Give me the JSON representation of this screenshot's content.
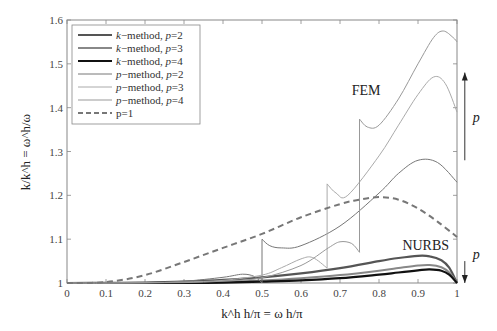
{
  "chart_data": {
    "type": "line",
    "title": "",
    "xlabel": "k^h h/π = ω h/π",
    "ylabel": "k/k^h = ω^h/ω",
    "xlim": [
      0,
      1
    ],
    "ylim": [
      1,
      1.6
    ],
    "xticks": [
      "0",
      "0.1",
      "0.2",
      "0.3",
      "0.4",
      "0.5",
      "0.6",
      "0.7",
      "0.8",
      "0.9",
      "1"
    ],
    "yticks": [
      "1",
      "1.1",
      "1.2",
      "1.3",
      "1.4",
      "1.5",
      "1.6"
    ],
    "grid": false,
    "legend_position": "upper left",
    "annotations": [
      {
        "text": "FEM",
        "x": 0.73,
        "y": 1.43
      },
      {
        "text": "NURBS",
        "x": 0.86,
        "y": 1.075
      },
      {
        "text": "p",
        "arrow": "up",
        "x": 1.02,
        "y_from": 1.28,
        "y_to": 1.48
      },
      {
        "text": "p",
        "arrow": "down",
        "x": 1.02,
        "y_from": 1.05,
        "y_to": 1.0
      }
    ],
    "series": [
      {
        "name": "k−method, p=2",
        "color": "#555555",
        "width": 2.2,
        "dash": "",
        "x": [
          0,
          0.1,
          0.2,
          0.3,
          0.4,
          0.5,
          0.6,
          0.7,
          0.8,
          0.85,
          0.9,
          0.93,
          0.96,
          0.98,
          1.0
        ],
        "y": [
          1,
          1.0003,
          1.001,
          1.003,
          1.007,
          1.013,
          1.022,
          1.034,
          1.05,
          1.057,
          1.062,
          1.061,
          1.052,
          1.035,
          1.0
        ]
      },
      {
        "name": "k−method, p=3",
        "color": "#888888",
        "width": 2.0,
        "dash": "",
        "x": [
          0,
          0.1,
          0.2,
          0.3,
          0.4,
          0.5,
          0.6,
          0.7,
          0.8,
          0.85,
          0.9,
          0.93,
          0.96,
          0.98,
          1.0
        ],
        "y": [
          1,
          1.0001,
          1.0004,
          1.001,
          1.003,
          1.006,
          1.011,
          1.018,
          1.028,
          1.034,
          1.04,
          1.041,
          1.036,
          1.024,
          1.0
        ]
      },
      {
        "name": "k−method, p=4",
        "color": "#111111",
        "width": 2.2,
        "dash": "",
        "x": [
          0,
          0.1,
          0.2,
          0.3,
          0.4,
          0.5,
          0.6,
          0.7,
          0.8,
          0.85,
          0.9,
          0.93,
          0.96,
          0.98,
          1.0
        ],
        "y": [
          1,
          1.0,
          1.0001,
          1.0004,
          1.001,
          1.003,
          1.006,
          1.011,
          1.019,
          1.024,
          1.029,
          1.031,
          1.028,
          1.019,
          1.0
        ]
      },
      {
        "name": "p−method, p=2",
        "color": "#777777",
        "width": 1.0,
        "dash": "",
        "x": [
          0,
          0.1,
          0.2,
          0.3,
          0.4,
          0.45,
          0.48,
          0.5,
          0.5,
          0.52,
          0.55,
          0.6,
          0.7,
          0.8,
          0.85,
          0.9,
          0.95,
          1.0
        ],
        "y": [
          1,
          1.0,
          1.001,
          1.004,
          1.013,
          1.02,
          1.015,
          1.0,
          1.1,
          1.085,
          1.08,
          1.085,
          1.13,
          1.205,
          1.25,
          1.28,
          1.275,
          1.23
        ]
      },
      {
        "name": "p−method, p=3",
        "color": "#aaaaaa",
        "width": 1.0,
        "dash": "",
        "x": [
          0,
          0.1,
          0.2,
          0.3,
          0.4,
          0.5,
          0.55,
          0.6,
          0.63,
          0.667,
          0.667,
          0.69,
          0.72,
          0.8,
          0.85,
          0.9,
          0.94,
          0.97,
          1.0
        ],
        "y": [
          1,
          1.0,
          1.0005,
          1.002,
          1.006,
          1.018,
          1.035,
          1.055,
          1.058,
          1.034,
          1.226,
          1.205,
          1.2,
          1.29,
          1.36,
          1.43,
          1.47,
          1.455,
          1.39
        ]
      },
      {
        "name": "p−method, p=4",
        "color": "#999999",
        "width": 1.0,
        "dash": "",
        "x": [
          0,
          0.1,
          0.2,
          0.3,
          0.4,
          0.5,
          0.6,
          0.67,
          0.7,
          0.73,
          0.75,
          0.75,
          0.77,
          0.8,
          0.85,
          0.9,
          0.94,
          0.965,
          0.99,
          1.0
        ],
        "y": [
          1,
          1.0,
          1.0003,
          1.001,
          1.004,
          1.012,
          1.04,
          1.08,
          1.094,
          1.09,
          1.07,
          1.374,
          1.356,
          1.36,
          1.42,
          1.5,
          1.56,
          1.575,
          1.56,
          1.55
        ]
      },
      {
        "name": "p=1",
        "color": "#777777",
        "width": 2.0,
        "dash": "6,4",
        "x": [
          0,
          0.1,
          0.2,
          0.3,
          0.4,
          0.5,
          0.6,
          0.7,
          0.75,
          0.8,
          0.85,
          0.9,
          0.95,
          1.0
        ],
        "y": [
          1,
          1.002,
          1.018,
          1.048,
          1.08,
          1.112,
          1.15,
          1.18,
          1.19,
          1.196,
          1.19,
          1.17,
          1.14,
          1.105
        ]
      }
    ]
  },
  "legend": {
    "items": [
      {
        "label": "k−method, p=2",
        "color": "#555555",
        "width": 2.2,
        "dash": ""
      },
      {
        "label": "k−method, p=3",
        "color": "#888888",
        "width": 2.0,
        "dash": ""
      },
      {
        "label": "k−method, p=4",
        "color": "#111111",
        "width": 2.2,
        "dash": ""
      },
      {
        "label": "p−method, p=2",
        "color": "#777777",
        "width": 1.0,
        "dash": ""
      },
      {
        "label": "p−method, p=3",
        "color": "#aaaaaa",
        "width": 1.0,
        "dash": ""
      },
      {
        "label": "p−method, p=4",
        "color": "#999999",
        "width": 1.0,
        "dash": ""
      },
      {
        "label": "p=1",
        "color": "#777777",
        "width": 2.0,
        "dash": "5,3"
      }
    ]
  }
}
